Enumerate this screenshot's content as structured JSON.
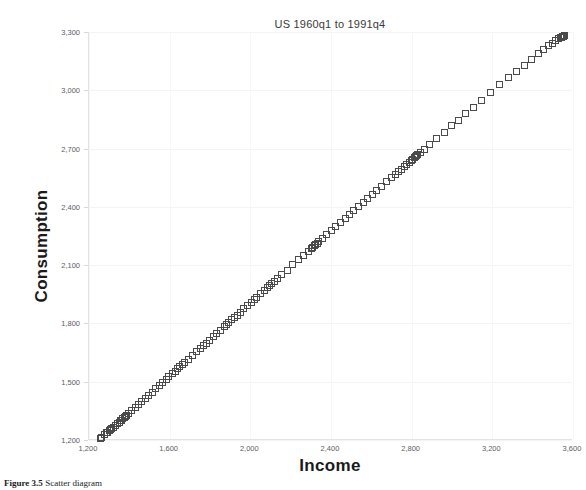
{
  "chart_data": {
    "type": "scatter",
    "title": "US 1960q1 to 1991q4",
    "xlabel": "Income",
    "ylabel": "Consumption",
    "xlim": [
      1200,
      3600
    ],
    "ylim": [
      1200,
      3300
    ],
    "grid": true,
    "legend": null,
    "marker": "hollow-square",
    "marker_color": "#4a4a4a",
    "xticks": [
      "1,200",
      "1,600",
      "2,000",
      "2,400",
      "2,800",
      "3,200",
      "3,600"
    ],
    "xtick_values": [
      1200,
      1600,
      2000,
      2400,
      2800,
      3200,
      3600
    ],
    "yticks": [
      "1,200",
      "1,500",
      "1,800",
      "2,100",
      "2,400",
      "2,700",
      "3,000",
      "3,300"
    ],
    "ytick_values": [
      1200,
      1500,
      1800,
      2100,
      2400,
      2700,
      3000,
      3300
    ],
    "x": [
      1257,
      1259,
      1262,
      1257,
      1277,
      1289,
      1292,
      1300,
      1306,
      1312,
      1320,
      1330,
      1341,
      1350,
      1356,
      1360,
      1368,
      1374,
      1379,
      1385,
      1398,
      1412,
      1430,
      1447,
      1462,
      1478,
      1495,
      1513,
      1531,
      1548,
      1565,
      1582,
      1596,
      1613,
      1628,
      1640,
      1651,
      1664,
      1676,
      1692,
      1712,
      1734,
      1753,
      1768,
      1781,
      1797,
      1815,
      1834,
      1852,
      1870,
      1883,
      1894,
      1907,
      1920,
      1934,
      1949,
      1968,
      1987,
      2004,
      2019,
      2033,
      2051,
      2069,
      2083,
      2096,
      2106,
      2118,
      2134,
      2156,
      2182,
      2211,
      2238,
      2264,
      2287,
      2301,
      2310,
      2316,
      2320,
      2325,
      2331,
      2340,
      2356,
      2378,
      2401,
      2424,
      2448,
      2470,
      2492,
      2514,
      2537,
      2560,
      2583,
      2605,
      2628,
      2652,
      2676,
      2699,
      2718,
      2733,
      2748,
      2762,
      2775,
      2788,
      2798,
      2806,
      2812,
      2818,
      2824,
      2831,
      2843,
      2862,
      2890,
      2925,
      2962,
      2998,
      3032,
      3068,
      3106,
      3148,
      3192,
      3238,
      3281,
      3320,
      3358,
      3395,
      3428,
      3455,
      3478,
      3498,
      3515,
      3528,
      3538,
      3545,
      3550,
      3554,
      3556,
      3558,
      3559
    ],
    "y": [
      1207,
      1209,
      1213,
      1209,
      1226,
      1237,
      1240,
      1247,
      1252,
      1258,
      1265,
      1274,
      1284,
      1292,
      1298,
      1302,
      1309,
      1315,
      1320,
      1326,
      1338,
      1352,
      1369,
      1385,
      1399,
      1414,
      1430,
      1447,
      1464,
      1480,
      1496,
      1512,
      1525,
      1541,
      1555,
      1566,
      1576,
      1588,
      1600,
      1615,
      1634,
      1655,
      1673,
      1687,
      1699,
      1714,
      1731,
      1749,
      1766,
      1783,
      1795,
      1806,
      1818,
      1830,
      1843,
      1857,
      1875,
      1893,
      1909,
      1923,
      1936,
      1953,
      1970,
      1983,
      1995,
      2004,
      2015,
      2030,
      2051,
      2075,
      2102,
      2127,
      2151,
      2172,
      2185,
      2193,
      2199,
      2203,
      2207,
      2213,
      2221,
      2236,
      2256,
      2277,
      2298,
      2320,
      2340,
      2360,
      2380,
      2401,
      2422,
      2443,
      2463,
      2484,
      2506,
      2528,
      2549,
      2566,
      2580,
      2593,
      2606,
      2618,
      2630,
      2639,
      2646,
      2652,
      2657,
      2662,
      2668,
      2679,
      2696,
      2721,
      2752,
      2785,
      2817,
      2847,
      2879,
      2913,
      2950,
      2988,
      3028,
      3065,
      3098,
      3130,
      3161,
      3188,
      3210,
      3228,
      3243,
      3255,
      3264,
      3270,
      3274,
      3277,
      3279,
      3280,
      3281,
      3282
    ]
  },
  "caption": {
    "figure_number": "Figure 3.5",
    "figure_text": "Scatter diagram"
  }
}
